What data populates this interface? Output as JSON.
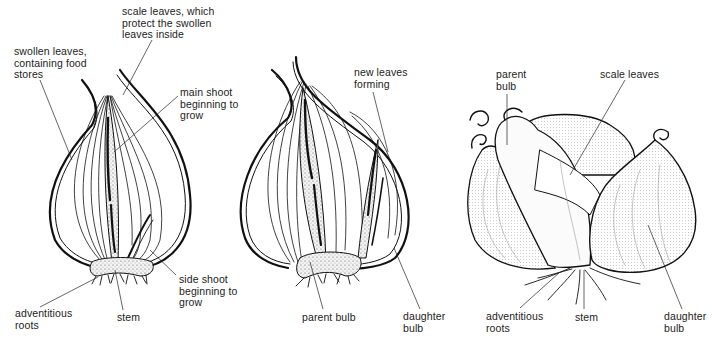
{
  "figure": {
    "panels": [
      {
        "id": "onion-bulb-section",
        "labels": [
          {
            "text": "swollen leaves,\ncontaining food\nstores",
            "x": 14,
            "y": 46
          },
          {
            "text": "scale leaves, which\nprotect the swollen\nleaves inside",
            "x": 122,
            "y": 6
          },
          {
            "text": "main shoot\nbeginning to\ngrow",
            "x": 180,
            "y": 87
          },
          {
            "text": "side shoot\nbeginning to\ngrow",
            "x": 179,
            "y": 274
          },
          {
            "text": "adventitious\nroots",
            "x": 15,
            "y": 308
          },
          {
            "text": "stem",
            "x": 117,
            "y": 312
          }
        ]
      },
      {
        "id": "onion-bulb-forming-daughter",
        "labels": [
          {
            "text": "new leaves\nforming",
            "x": 354,
            "y": 67
          },
          {
            "text": "parent bulb",
            "x": 302,
            "y": 312
          },
          {
            "text": "daughter\nbulb",
            "x": 403,
            "y": 311
          }
        ]
      },
      {
        "id": "shallot-cluster",
        "labels": [
          {
            "text": "parent\nbulb",
            "x": 496,
            "y": 69
          },
          {
            "text": "scale leaves",
            "x": 600,
            "y": 69
          },
          {
            "text": "adventitious\nroots",
            "x": 486,
            "y": 311
          },
          {
            "text": "stem",
            "x": 575,
            "y": 312
          },
          {
            "text": "daughter\nbulb",
            "x": 664,
            "y": 311
          }
        ]
      }
    ]
  }
}
